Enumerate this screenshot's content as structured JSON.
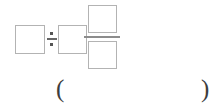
{
  "expression": {
    "type": "arithmetic-division-with-fraction",
    "operands": {
      "dividend_box": "",
      "divisor_box": "",
      "fraction_numerator_box": "",
      "fraction_denominator_box": ""
    },
    "operator_symbol": "÷",
    "operator_name": "division-sign"
  },
  "answer": {
    "open_paren": "(",
    "close_paren": ")",
    "value": "",
    "placeholder": ""
  }
}
